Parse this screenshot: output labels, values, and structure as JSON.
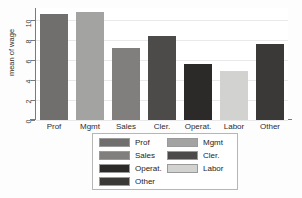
{
  "chart_data": {
    "type": "bar",
    "title": "",
    "xlabel": "",
    "ylabel": "mean of wage",
    "categories": [
      "Prof",
      "Mgmt",
      "Sales",
      "Cler.",
      "Operat.",
      "Labor",
      "Other"
    ],
    "values": [
      10.6,
      10.8,
      7.2,
      8.4,
      5.6,
      4.9,
      7.6
    ],
    "ylim": [
      0,
      11.2
    ],
    "ytick_labels": [
      "0",
      "2",
      "4",
      "6",
      "8",
      "10"
    ],
    "ytick_values": [
      0,
      2,
      4,
      6,
      8,
      10
    ],
    "grid": true,
    "grid_axis": "y",
    "legend_position": "bottom",
    "bar_colors": [
      "#706f6e",
      "#a3a3a1",
      "#807f7e",
      "#4c4b4a",
      "#2b2a29",
      "#d2d2d0",
      "#3a3938"
    ],
    "series": [
      {
        "name": "mean of wage",
        "values": [
          10.6,
          10.8,
          7.2,
          8.4,
          5.6,
          4.9,
          7.6
        ]
      }
    ]
  },
  "axis": {
    "y_title": "mean of wage",
    "y_ticks": [
      {
        "label": "10",
        "value": 10
      },
      {
        "label": "8",
        "value": 8
      },
      {
        "label": "6",
        "value": 6
      },
      {
        "label": "4",
        "value": 4
      },
      {
        "label": "2",
        "value": 2
      },
      {
        "label": "0",
        "value": 0
      }
    ],
    "x_ticks": [
      {
        "label": "Prof"
      },
      {
        "label": "Mgmt"
      },
      {
        "label": "Sales"
      },
      {
        "label": "Cler."
      },
      {
        "label": "Operat."
      },
      {
        "label": "Labor"
      },
      {
        "label": "Other"
      }
    ]
  },
  "legend": {
    "entries": [
      {
        "label": "Prof",
        "color": "#706f6e",
        "column": 0,
        "row": 0
      },
      {
        "label": "Mgmt",
        "color": "#a3a3a1",
        "column": 1,
        "row": 0
      },
      {
        "label": "Sales",
        "color": "#807f7e",
        "column": 0,
        "row": 1
      },
      {
        "label": "Cler.",
        "color": "#4c4b4a",
        "column": 1,
        "row": 1
      },
      {
        "label": "Operat.",
        "color": "#2b2a29",
        "column": 0,
        "row": 2
      },
      {
        "label": "Labor",
        "color": "#d2d2d0",
        "column": 1,
        "row": 2
      },
      {
        "label": "Other",
        "color": "#3a3938",
        "column": 0,
        "row": 3
      }
    ]
  },
  "colors": {
    "background": "#fdfdfd",
    "plot_background": "#ffffff",
    "axis": "#7a7a7a",
    "grid": "#e9e9e9",
    "text": "#2d2d2d",
    "legend_border": "#b6b6b6"
  }
}
